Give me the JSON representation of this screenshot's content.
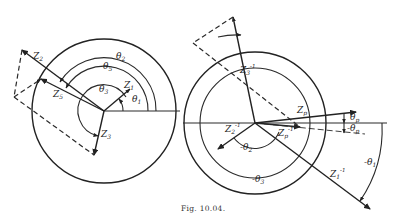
{
  "figure": {
    "caption": "Fig. 10.04.",
    "left_diagram": {
      "labels": {
        "z1": "Z",
        "z1_sub": "1",
        "z2": "Z",
        "z2_sub": "2",
        "z3": "Z",
        "z3_sub": "3",
        "z5": "Z",
        "z5_sub": "5",
        "theta1": "θ",
        "theta1_sub": "1",
        "theta2": "θ",
        "theta2_sub": "2",
        "theta3": "θ",
        "theta3_sub": "3",
        "theta5": "θ",
        "theta5_sub": "5"
      }
    },
    "right_diagram": {
      "labels": {
        "z1inv": "Z",
        "z1inv_sub": "1",
        "z1inv_sup": "-1",
        "z2inv": "Z",
        "z2inv_sub": "2",
        "z2inv_sup": "-1",
        "z3inv": "Z",
        "z3inv_sub": "3",
        "z3inv_sup": "-1",
        "zp": "Z",
        "zp_sub": "p",
        "zpinv": "Z",
        "zpinv_sub": "p",
        "zpinv_sup": "-1",
        "thetap": "θ",
        "thetap_sub": "p",
        "neg_thetap": "-θ",
        "neg_thetap_sub": "p",
        "neg_theta1": "-θ",
        "neg_theta1_sub": "1",
        "neg_theta2": "-θ",
        "neg_theta2_sub": "2",
        "neg_theta3": "-θ",
        "neg_theta3_sub": "3"
      }
    }
  }
}
